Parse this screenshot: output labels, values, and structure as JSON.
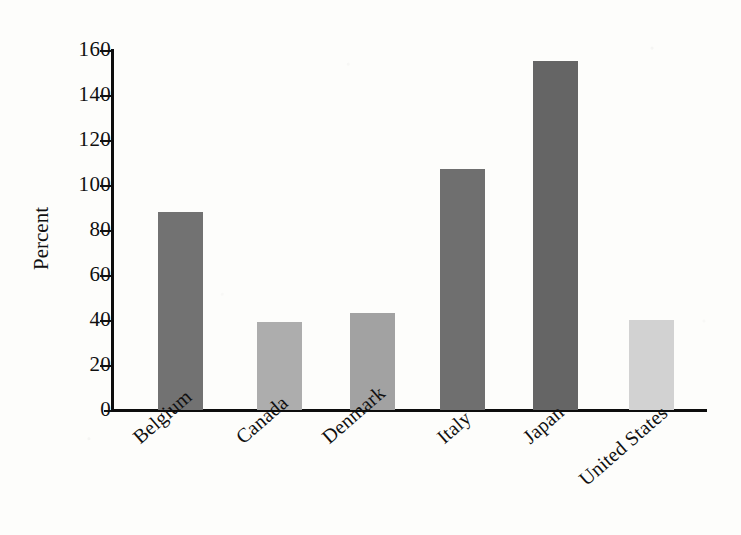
{
  "chart_data": {
    "type": "bar",
    "title": "",
    "subtitle": "",
    "xlabel": "",
    "ylabel": "Percent",
    "categories": [
      "Belgium",
      "Canada",
      "Denmark",
      "Italy",
      "Japan",
      "United States"
    ],
    "values": [
      88,
      39,
      43,
      107,
      155,
      40
    ],
    "series": [
      {
        "name": "Percent",
        "values": [
          88,
          39,
          43,
          107,
          155,
          40
        ]
      }
    ],
    "bar_colors": [
      "#727272",
      "#adadad",
      "#a2a2a2",
      "#6f6f6f",
      "#656565",
      "#d2d2d2"
    ],
    "ylim": [
      0,
      160
    ],
    "ytick_labels": [
      "0",
      "20",
      "40",
      "60",
      "80",
      "100",
      "120",
      "140",
      "160"
    ],
    "ytick_values": [
      0,
      20,
      40,
      60,
      80,
      100,
      120,
      140,
      160
    ],
    "grid": false,
    "legend": false,
    "legend_position": "none",
    "tick_label_rotation_deg": -41,
    "annotations": []
  },
  "figure": {
    "background_color": "#fdfdfb",
    "axis_color": "#0d0d0d"
  }
}
